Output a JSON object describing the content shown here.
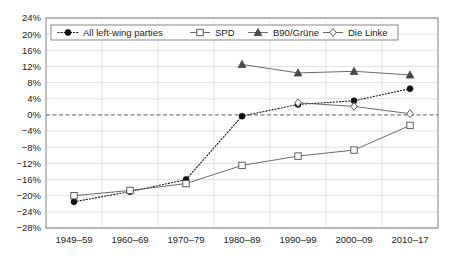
{
  "chart_data": {
    "type": "line",
    "title": "",
    "xlabel": "",
    "ylabel": "",
    "categories": [
      "1949–59",
      "1960–69",
      "1970–79",
      "1980–89",
      "1990–99",
      "2000–09",
      "2010–17"
    ],
    "ylim": [
      -28,
      24
    ],
    "yticks": [
      24,
      20,
      16,
      12,
      8,
      4,
      0,
      -4,
      -8,
      -12,
      -16,
      -20,
      -24,
      -28
    ],
    "ytick_labels": [
      "24%",
      "20%",
      "16%",
      "12%",
      "8%",
      "4%",
      "0%",
      "−4%",
      "−8%",
      "−12%",
      "−16%",
      "−20%",
      "−24%",
      "−28%"
    ],
    "grid": true,
    "zero_reference_line": true,
    "legend_position": "top-left-inside",
    "series": [
      {
        "name": "All left-wing parties",
        "marker": "filled-circle",
        "line_style": "dotted",
        "color": "#111111",
        "values": [
          -21.5,
          -19.0,
          -16.0,
          -0.3,
          2.6,
          3.5,
          6.5
        ]
      },
      {
        "name": "SPD",
        "marker": "open-square",
        "line_style": "solid",
        "color": "#595959",
        "values": [
          -20.0,
          -18.7,
          -17.0,
          -12.5,
          -10.2,
          -8.7,
          -2.6
        ]
      },
      {
        "name": "B90/Grüne",
        "marker": "filled-triangle",
        "line_style": "solid",
        "color": "#4a4a4a",
        "values": [
          null,
          null,
          null,
          12.5,
          10.4,
          10.8,
          9.9
        ]
      },
      {
        "name": "Die Linke",
        "marker": "open-diamond",
        "line_style": "solid",
        "color": "#4d4d4d",
        "values": [
          null,
          null,
          null,
          null,
          3.0,
          2.1,
          0.3
        ]
      }
    ]
  },
  "legend": {
    "entries": [
      {
        "label": "All left-wing parties"
      },
      {
        "label": "SPD"
      },
      {
        "label": "B90/Grüne"
      },
      {
        "label": "Die Linke"
      }
    ]
  }
}
